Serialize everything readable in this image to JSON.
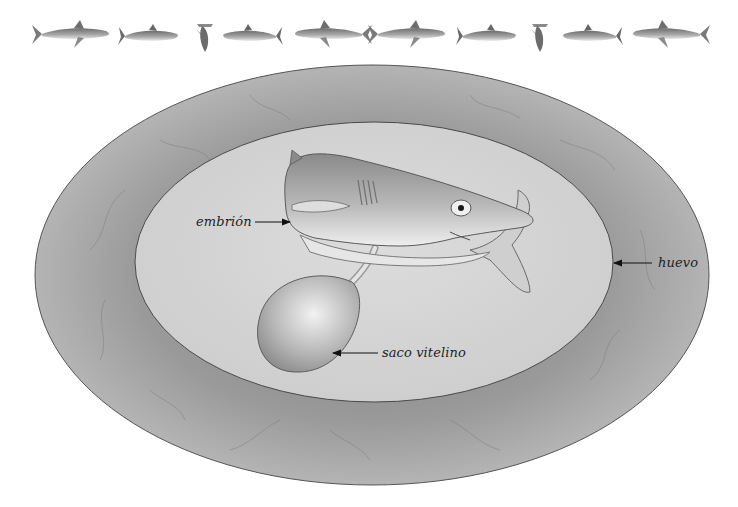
{
  "diagram": {
    "labels": {
      "embryo": "embrión",
      "egg": "huevo",
      "yolk_sac": "saco vitelino"
    },
    "border_sharks": [
      "oceanic-whitetip",
      "great-white",
      "hammerhead",
      "great-white",
      "oceanic-whitetip",
      "oceanic-whitetip",
      "great-white",
      "hammerhead",
      "great-white",
      "oceanic-whitetip"
    ],
    "colors": {
      "background": "#ffffff",
      "egg_outer": "#9e9e9e",
      "egg_inner": "#d6d6d6",
      "outline": "#555555",
      "label_text": "#1e1e1e",
      "arrow": "#111111"
    }
  }
}
